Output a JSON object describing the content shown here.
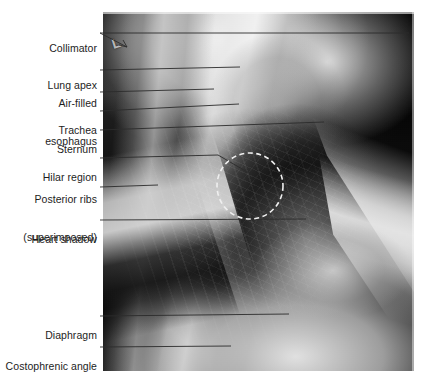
{
  "figure": {
    "type": "annotated-radiograph",
    "modality": "lateral chest radiograph",
    "background_color": "#ffffff",
    "label_text_color": "#1d1d1d",
    "leader_line_color": "#2b2b2b",
    "marker_overlay_color": "#efefef"
  },
  "xray": {
    "side_marker": "L",
    "plate_bounds": {
      "x": 103,
      "y": 12,
      "width": 311,
      "height": 359
    }
  },
  "annotations": [
    {
      "id": "collimator",
      "label": "Collimator",
      "lines": [
        "Collimator"
      ],
      "text_x": 97,
      "text_y": 23,
      "leader": {
        "x1": 100,
        "y1": 33,
        "x2": 409,
        "y2": 33
      },
      "leader2": {
        "x1": 100,
        "y1": 33,
        "x2": 127,
        "y2": 47
      },
      "has_arrow": true
    },
    {
      "id": "lung-apex",
      "label": "Lung apex",
      "lines": [
        "Lung apex"
      ],
      "text_x": 97,
      "text_y": 60,
      "leader": {
        "x1": 100,
        "y1": 70,
        "x2": 240,
        "y2": 67
      }
    },
    {
      "id": "air-filled-esophagus",
      "label": "Air-filled esophagus",
      "lines": [
        "Air-filled",
        "esophagus"
      ],
      "text_x": 97,
      "text_y": 78,
      "leader": {
        "x1": 100,
        "y1": 92,
        "x2": 214,
        "y2": 89
      }
    },
    {
      "id": "trachea",
      "label": "Trachea",
      "lines": [
        "Trachea"
      ],
      "text_x": 97,
      "text_y": 101,
      "leader": {
        "x1": 100,
        "y1": 111,
        "x2": 239,
        "y2": 104
      }
    },
    {
      "id": "sternum",
      "label": "Sternum",
      "lines": [
        "Sternum"
      ],
      "text_x": 97,
      "text_y": 120,
      "leader": {
        "x1": 100,
        "y1": 130,
        "x2": 324,
        "y2": 122
      }
    },
    {
      "id": "hilar-region",
      "label": "Hilar region",
      "lines": [
        "Hilar region"
      ],
      "text_x": 97,
      "text_y": 148,
      "leader_path": "M100,158 L218,155 L249,173"
    },
    {
      "id": "posterior-ribs-superimposed",
      "label": "Posterior ribs (superimposed)",
      "lines": [
        "Posterior ribs",
        "(superimposed)"
      ],
      "text_x": 97,
      "text_y": 173,
      "leader": {
        "x1": 100,
        "y1": 187,
        "x2": 158,
        "y2": 185
      }
    },
    {
      "id": "heart-shadow",
      "label": "Heart shadow",
      "lines": [
        "Heart shadow"
      ],
      "text_x": 97,
      "text_y": 210,
      "leader": {
        "x1": 100,
        "y1": 220,
        "x2": 306,
        "y2": 219
      }
    },
    {
      "id": "diaphragm",
      "label": "Diaphragm",
      "lines": [
        "Diaphragm"
      ],
      "text_x": 97,
      "text_y": 306,
      "leader": {
        "x1": 100,
        "y1": 316,
        "x2": 289,
        "y2": 314
      }
    },
    {
      "id": "costophrenic-angle",
      "label": "Costophrenic angle",
      "lines": [
        "Costophrenic angle"
      ],
      "text_x": 97,
      "text_y": 338,
      "leader": {
        "x1": 100,
        "y1": 347,
        "x2": 231,
        "y2": 346
      }
    }
  ],
  "hilar_marker": {
    "shape": "dashed-circle",
    "cx": 250,
    "cy": 186,
    "r": 33
  }
}
